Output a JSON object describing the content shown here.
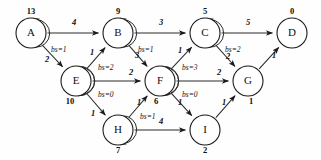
{
  "figure": {
    "type": "directed-weighted-graph",
    "background_color": "#ffffff",
    "stroke_color": "#2b2b2b",
    "width": 321,
    "height": 160
  },
  "chart_data": {
    "type": "diagram",
    "title": "",
    "nodes": [
      {
        "id": "A",
        "label": "A",
        "value": "13",
        "x": 31,
        "y": 33,
        "r": 15,
        "value_dx": 0,
        "value_dy": -21
      },
      {
        "id": "B",
        "label": "B",
        "value": "9",
        "x": 118,
        "y": 33,
        "r": 15,
        "value_dx": 0,
        "value_dy": -21
      },
      {
        "id": "C",
        "label": "C",
        "value": "5",
        "x": 205,
        "y": 33,
        "r": 15,
        "value_dx": 0,
        "value_dy": -21
      },
      {
        "id": "D",
        "label": "D",
        "value": "0",
        "x": 292,
        "y": 33,
        "r": 15,
        "value_dx": 0,
        "value_dy": -21
      },
      {
        "id": "E",
        "label": "E",
        "value": "10",
        "x": 76,
        "y": 81,
        "r": 15,
        "value_dx": -6,
        "value_dy": 21
      },
      {
        "id": "F",
        "label": "F",
        "value": "6",
        "x": 160,
        "y": 81,
        "r": 15,
        "value_dx": -4,
        "value_dy": 21
      },
      {
        "id": "G",
        "label": "G",
        "value": "1",
        "x": 248,
        "y": 81,
        "r": 15,
        "value_dx": 3,
        "value_dy": 21
      },
      {
        "id": "H",
        "label": "H",
        "value": "7",
        "x": 118,
        "y": 130,
        "r": 15,
        "value_dx": 0,
        "value_dy": 21
      },
      {
        "id": "I",
        "label": "I",
        "value": "2",
        "x": 205,
        "y": 130,
        "r": 15,
        "value_dx": 0,
        "value_dy": 21
      }
    ],
    "edges": [
      {
        "from": "A",
        "to": "B",
        "weight": "4",
        "lx": 74,
        "ly": 23
      },
      {
        "from": "A",
        "to": "E",
        "weight": "2",
        "lx": 47,
        "ly": 60
      },
      {
        "from": "E",
        "to": "B",
        "weight": "1",
        "lx": 92,
        "ly": 53
      },
      {
        "from": "E",
        "to": "F",
        "weight": "2",
        "lx": 131,
        "ly": 73
      },
      {
        "from": "E",
        "to": "H",
        "weight": "1",
        "lx": 93,
        "ly": 114
      },
      {
        "from": "B",
        "to": "C",
        "weight": "3",
        "lx": 161,
        "ly": 23
      },
      {
        "from": "B",
        "to": "F",
        "weight": "3",
        "lx": 137,
        "ly": 56
      },
      {
        "from": "F",
        "to": "C",
        "weight": "1",
        "lx": 180,
        "ly": 51
      },
      {
        "from": "F",
        "to": "G",
        "weight": "2",
        "lx": 219,
        "ly": 73
      },
      {
        "from": "F",
        "to": "I",
        "weight": "1",
        "lx": 180,
        "ly": 103
      },
      {
        "from": "H",
        "to": "F",
        "weight": "1",
        "lx": 139,
        "ly": 103
      },
      {
        "from": "H",
        "to": "I",
        "weight": "4",
        "lx": 161,
        "ly": 122
      },
      {
        "from": "I",
        "to": "G",
        "weight": "1",
        "lx": 224,
        "ly": 103
      },
      {
        "from": "C",
        "to": "D",
        "weight": "5",
        "lx": 248,
        "ly": 23
      },
      {
        "from": "C",
        "to": "G",
        "weight": "2",
        "lx": 228,
        "ly": 57
      },
      {
        "from": "G",
        "to": "D",
        "weight": "1",
        "lx": 274,
        "ly": 56
      }
    ],
    "self_loops": [
      {
        "node": "A",
        "label": "bs=1",
        "lx": 51,
        "ly": 50,
        "side": "bottom-right"
      },
      {
        "node": "B",
        "label": "bs=1",
        "lx": 138,
        "ly": 50,
        "side": "bottom-right"
      },
      {
        "node": "C",
        "label": "bs=2",
        "lx": 225,
        "ly": 50,
        "side": "bottom-right"
      },
      {
        "node": "E",
        "label": "bs=2",
        "lx": 98,
        "ly": 68,
        "side": "top-right"
      },
      {
        "node": "E",
        "label": "bs=0",
        "lx": 98,
        "ly": 95,
        "side": "bottom-right"
      },
      {
        "node": "F",
        "label": "bs=3",
        "lx": 182,
        "ly": 68,
        "side": "top-right"
      },
      {
        "node": "F",
        "label": "bs=0",
        "lx": 182,
        "ly": 95,
        "side": "bottom-right"
      },
      {
        "node": "H",
        "label": "bs=1",
        "lx": 140,
        "ly": 117,
        "side": "top-right"
      }
    ],
    "notes": {
      "node_value_meaning": "bold number adjacent to each node",
      "edge_weight_style": "italic bold numerals on each directed edge",
      "loop_label_style": "italic bs=N annotation beside each self-loop arc"
    }
  }
}
